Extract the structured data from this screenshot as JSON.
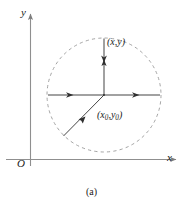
{
  "figure": {
    "caption": "(a)",
    "axes": {
      "x_label": "x",
      "y_label": "y",
      "origin_label": "O"
    },
    "labels": {
      "field_point": "(x,y)",
      "source_point_prefix": "(x",
      "source_point_sub1": "0",
      "source_point_mid": ",y",
      "source_point_sub2": "0",
      "source_point_suffix": ")"
    },
    "colors": {
      "stroke": "#3a3a3a",
      "axis": "#8a8a8a",
      "dashed_circle": "#9a9a9a",
      "background": "#ffffff",
      "text": "#1a1a1a"
    },
    "geometry": {
      "center_x": 104,
      "center_y": 95,
      "radius": 57,
      "circle_style": "dashed",
      "vector_count": 4,
      "vector_directions": [
        "up",
        "left",
        "right",
        "lower-left"
      ]
    }
  }
}
